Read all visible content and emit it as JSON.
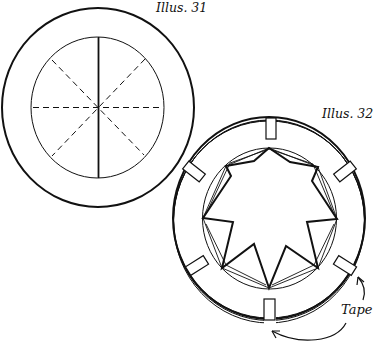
{
  "illustrations": [
    {
      "id": "illus-31",
      "caption": "Illus. 31",
      "description": "Circle of paper inside a ring; one solid fold line (vertical) and three dashed fold lines dividing the inner circle into eight sections"
    },
    {
      "id": "illus-32",
      "caption": "Illus. 32",
      "description": "Ring with six tabs; inner circle folded into an eight-pointed star; layered ring edges taped at the bottom"
    }
  ],
  "annotations": {
    "tape_label": "Tape"
  },
  "colors": {
    "line": "#111111",
    "background": "#ffffff"
  }
}
